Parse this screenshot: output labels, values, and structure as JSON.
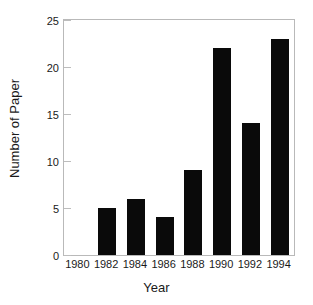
{
  "chart_data": {
    "type": "bar",
    "title": "",
    "xlabel": "Year",
    "ylabel": "Number of Paper",
    "categories": [
      "1982",
      "1984",
      "1986",
      "1988",
      "1990",
      "1992",
      "1994"
    ],
    "values": [
      5,
      6,
      4,
      9,
      22,
      14,
      23
    ],
    "xtick_labels": [
      "1980",
      "1982",
      "1984",
      "1986",
      "1988",
      "1990",
      "1992",
      "1994"
    ],
    "ytick_labels": [
      "0",
      "5",
      "10",
      "15",
      "20",
      "25"
    ],
    "ytick_values": [
      0,
      5,
      10,
      15,
      20,
      25
    ],
    "ylim": [
      0,
      25
    ],
    "grid": false,
    "legend": null,
    "bar_color": "#0a0a0a",
    "axis_color": "#b9b9b9",
    "text_color": "#1a1a1a",
    "background": "#ffffff"
  }
}
